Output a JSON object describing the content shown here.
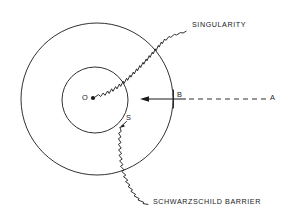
{
  "figure": {
    "background_color": "#ffffff",
    "stroke_color": "#1a1a1a"
  },
  "labels": {
    "singularity": "SINGULARITY",
    "schwarzschild_barrier": "SCHWARZSCHILD BARRIER",
    "origin": "O",
    "surface": "S",
    "point_b": "B",
    "point_a": "A"
  },
  "geometry": {
    "outer_circle": {
      "cx": 97,
      "cy": 99,
      "r": 76,
      "name": "schwarzschild-barrier-circle"
    },
    "inner_circle": {
      "cx": 95,
      "cy": 100,
      "r": 33,
      "name": "inner-surface-circle"
    },
    "center_dot": {
      "cx": 93,
      "cy": 98,
      "r": 2.1
    },
    "ray_arrow_tip": {
      "x": 143,
      "y": 99
    },
    "ray_solid_end": {
      "x": 173,
      "y": 99
    },
    "ray_dashed_end": {
      "x": 266,
      "y": 99
    }
  },
  "elements": [
    {
      "name": "singularity-wavy-line",
      "kind": "wavy-line",
      "description": "jagged line from center dot outward through upper-right annulus to the SINGULARITY caption"
    },
    {
      "name": "lower-wavy-line",
      "kind": "wavy-line",
      "description": "jagged line from inner circle downward through lower-right annulus to the SCHWARZSCHILD BARRIER caption"
    },
    {
      "name": "infalling-ray",
      "kind": "ray",
      "description": "dashed ray from A travelling leftward, becoming solid inside the barrier at B, arrowhead pointing left"
    },
    {
      "name": "surface-pointer",
      "kind": "leader-line",
      "description": "short arrow from label S pointing to the inner circle boundary"
    }
  ]
}
